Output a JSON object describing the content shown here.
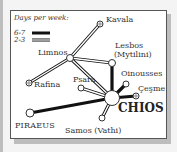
{
  "legend": {
    "title": "Days per week:",
    "items": [
      {
        "label": "6-7",
        "style": "thick-solid"
      },
      {
        "label": "2-3",
        "style": "double-line"
      }
    ]
  },
  "ports": {
    "kavala": "Kavala",
    "limnos": "Limnos",
    "lesbos": "Lesbos",
    "lesbos_alt": "(Mytilini)",
    "rafina": "Rafina",
    "psara": "Psara",
    "oinousses": "Oinousses",
    "cesme": "Çeşme",
    "chios": "CHIOS",
    "piraeus": "PIRAEUS",
    "samos": "Samos (Vathi)"
  },
  "colors": {
    "line": "#111111",
    "background": "#ffffff",
    "frame": "#555555",
    "shadow": "#bdbdbd"
  }
}
